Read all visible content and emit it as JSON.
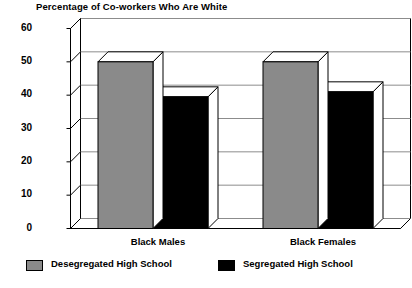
{
  "chart_data": {
    "type": "bar",
    "title": "Percentage of Co-workers Who Are White",
    "xlabel": "",
    "ylabel": "",
    "ylim": [
      0,
      60
    ],
    "yticks": [
      0,
      10,
      20,
      30,
      40,
      50,
      60
    ],
    "ytick_labels": [
      "0",
      "10",
      "20",
      "30",
      "40",
      "50",
      "60"
    ],
    "grid": true,
    "legend_position": "bottom",
    "style": "3d-bar",
    "categories": [
      "Black Males",
      "Black Females"
    ],
    "series": [
      {
        "name": "Desegregated High School",
        "color": "#8a8a8a",
        "values": [
          50,
          50
        ]
      },
      {
        "name": "Segregated High School",
        "color": "#000000",
        "values": [
          39.5,
          41
        ]
      }
    ]
  },
  "legend": {
    "items": [
      {
        "label": "Desegregated High School",
        "color": "#8a8a8a"
      },
      {
        "label": "Segregated High School",
        "color": "#000000"
      }
    ]
  },
  "axis": {
    "y_labels": [
      "60",
      "50",
      "40",
      "30",
      "20",
      "10",
      "0"
    ]
  },
  "colors": {
    "bar_gray": "#8a8a8a",
    "bar_black": "#000000",
    "axis_line": "#000000",
    "grid_line": "#8c8c8c",
    "wall": "#ffffff",
    "text": "#000000"
  }
}
